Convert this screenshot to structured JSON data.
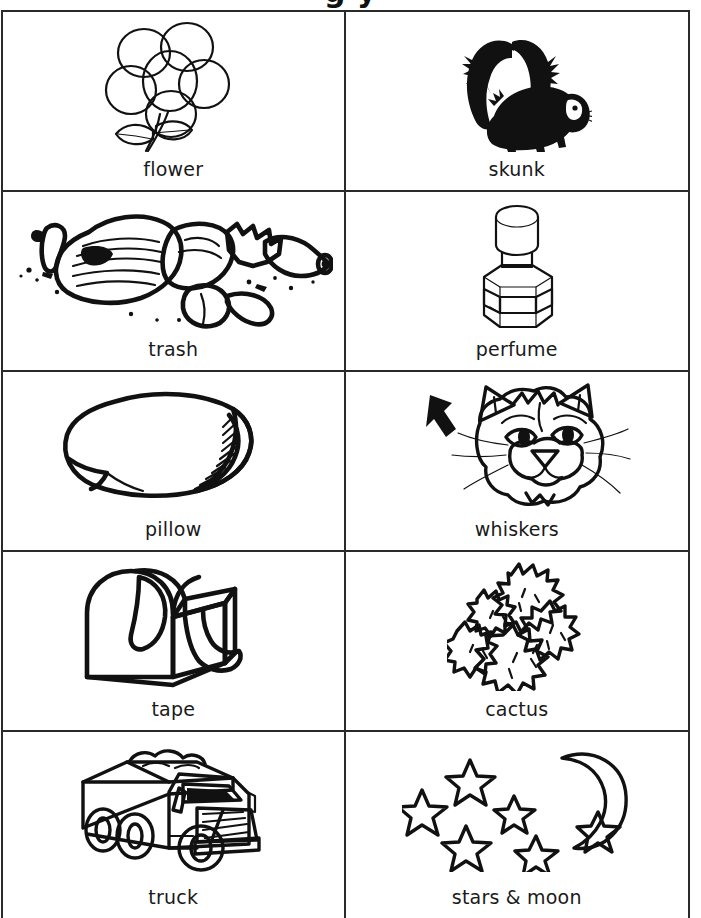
{
  "page": {
    "title_partial": "g    y",
    "background": "#ffffff",
    "ink_color": "#111111",
    "border_color": "#2a2a2a"
  },
  "worksheet": {
    "columns": 2,
    "rows": 5,
    "cells": [
      {
        "id": "flower",
        "label": "flower",
        "icon": "flower-drawing",
        "column": "left",
        "row": 1
      },
      {
        "id": "skunk",
        "label": "skunk",
        "icon": "skunk-drawing",
        "column": "right",
        "row": 1
      },
      {
        "id": "trash",
        "label": "trash",
        "icon": "trash-drawing",
        "column": "left",
        "row": 2
      },
      {
        "id": "perfume",
        "label": "perfume",
        "icon": "perfume-drawing",
        "column": "right",
        "row": 2
      },
      {
        "id": "pillow",
        "label": "pillow",
        "icon": "pillow-drawing",
        "column": "left",
        "row": 3
      },
      {
        "id": "whiskers",
        "label": "whiskers",
        "icon": "cat-whiskers-drawing",
        "column": "right",
        "row": 3
      },
      {
        "id": "tape",
        "label": "tape",
        "icon": "tape-drawing",
        "column": "left",
        "row": 4
      },
      {
        "id": "cactus",
        "label": "cactus",
        "icon": "cactus-drawing",
        "column": "right",
        "row": 4
      },
      {
        "id": "truck",
        "label": "truck",
        "icon": "truck-drawing",
        "column": "left",
        "row": 5
      },
      {
        "id": "stars_moon",
        "label": "stars & moon",
        "icon": "stars-moon-drawing",
        "column": "right",
        "row": 5
      }
    ]
  }
}
